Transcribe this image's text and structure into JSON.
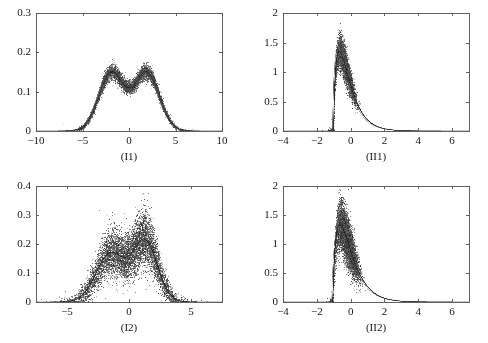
{
  "figure": {
    "background_color": "#ffffff",
    "width": 488,
    "height": 343,
    "layout": "2x2 grid of scatter-band density plots",
    "ink_color": "#262626",
    "axis_color": "#555555"
  },
  "chart_data": [
    {
      "id": "I1",
      "type": "scatter",
      "title": "",
      "caption": "(I1)",
      "xlabel": "",
      "ylabel": "",
      "xlim": [
        -10,
        10
      ],
      "ylim": [
        0,
        0.3
      ],
      "grid": false,
      "legend": "none",
      "xticks": [
        -10,
        -5,
        0,
        5,
        10
      ],
      "xtick_labels": [
        "-10",
        "-5",
        "0",
        "5",
        "10"
      ],
      "yticks": [
        0,
        0.1,
        0.2,
        0.3
      ],
      "ytick_labels": [
        "0",
        "0.1",
        "0.2",
        "0.3"
      ],
      "description": "Dense cloud of estimated bimodal density curves (mixture of two normals) plus smooth reference curves; symmetric twin peaks near x=-1.9 and x=+1.9 reaching about 0.195, local minimum near x=0 around 0.095, tails decaying to 0 by |x|=6.",
      "density_model": {
        "family": "gaussian-mixture",
        "components": [
          {
            "weight": 0.5,
            "mean": -1.9,
            "sd": 1.35
          },
          {
            "weight": 0.5,
            "mean": 1.9,
            "sd": 1.35
          }
        ]
      },
      "annotations": [
        {
          "x": -1.9,
          "y": 0.195,
          "text": "left peak"
        },
        {
          "x": 0.0,
          "y": 0.095,
          "text": "central dip"
        },
        {
          "x": 1.9,
          "y": 0.195,
          "text": "right peak"
        }
      ],
      "noise_scale": 0.055,
      "reference_curves": 6,
      "point_count": 5200,
      "point_size": 0.8
    },
    {
      "id": "II1",
      "type": "scatter",
      "title": "",
      "caption": "(II1)",
      "xlabel": "",
      "ylabel": "",
      "xlim": [
        -4,
        7
      ],
      "ylim": [
        0,
        2
      ],
      "grid": false,
      "legend": "none",
      "xticks": [
        -4,
        -2,
        0,
        2,
        4,
        6
      ],
      "xtick_labels": [
        "-4",
        "-2",
        "0",
        "2",
        "4",
        "6"
      ],
      "yticks": [
        0,
        0.5,
        1,
        1.5,
        2
      ],
      "ytick_labels": [
        "0",
        "0.5",
        "1",
        "1.5",
        "2"
      ],
      "description": "Right-skewed density estimates with a sharp left shoulder at x=-0.95; peak height about 1.35 on the solid reference curve with scatter reaching 1.6; long right tail decaying toward 0 by x=4.",
      "density_model": {
        "family": "shifted-gamma",
        "shift": -1.0,
        "shape": 1.6,
        "scale": 0.55,
        "peak_x": -0.85,
        "peak_y": 1.35
      },
      "annotations": [
        {
          "x": -0.85,
          "y": 1.35,
          "text": "mode"
        },
        {
          "x": 2.0,
          "y": 0.15,
          "text": "right tail"
        }
      ],
      "noise_scale": 0.09,
      "reference_curves": 3,
      "point_count": 5200,
      "point_size": 0.8
    },
    {
      "id": "I2",
      "type": "scatter",
      "title": "",
      "caption": "(I2)",
      "xlabel": "",
      "ylabel": "",
      "xlim": [
        -7.5,
        7.5
      ],
      "ylim": [
        0,
        0.4
      ],
      "grid": false,
      "legend": "none",
      "xticks": [
        -5,
        0,
        5
      ],
      "xtick_labels": [
        "-5",
        "0",
        "5"
      ],
      "yticks": [
        0,
        0.1,
        0.2,
        0.3,
        0.4
      ],
      "ytick_labels": [
        "0",
        "0.1",
        "0.2",
        "0.3",
        "0.4"
      ],
      "description": "Wide noisy cloud of bimodal density estimates; left peak near x=-1.5 at about 0.22 and right peak near x=1.3 reaching about 0.27 with scatter up to 0.35; dip near x=0 around 0.12; support roughly -4 to 4 with sparse points to the plot edges.",
      "density_model": {
        "family": "gaussian-mixture",
        "components": [
          {
            "weight": 0.48,
            "mean": -1.5,
            "sd": 1.15
          },
          {
            "weight": 0.52,
            "mean": 1.3,
            "sd": 1.0
          }
        ]
      },
      "annotations": [
        {
          "x": -1.5,
          "y": 0.22,
          "text": "left peak"
        },
        {
          "x": 0.0,
          "y": 0.12,
          "text": "central dip"
        },
        {
          "x": 1.3,
          "y": 0.27,
          "text": "right peak"
        }
      ],
      "noise_scale": 0.19,
      "reference_curves": 2,
      "point_count": 6400,
      "point_size": 0.9
    },
    {
      "id": "II2",
      "type": "scatter",
      "title": "",
      "caption": "(II2)",
      "xlabel": "",
      "ylabel": "",
      "xlim": [
        -4,
        7
      ],
      "ylim": [
        0,
        2
      ],
      "grid": false,
      "legend": "none",
      "xticks": [
        -4,
        -2,
        0,
        2,
        4,
        6
      ],
      "xtick_labels": [
        "-4",
        "-2",
        "0",
        "2",
        "4",
        "6"
      ],
      "yticks": [
        0,
        0.5,
        1,
        1.5,
        2
      ],
      "ytick_labels": [
        "0",
        "0.5",
        "1",
        "1.5",
        "2"
      ],
      "description": "Right-skewed density estimates similar to (II1) but with a broader noisier band; sharp left edge near x=-1.0, mode about 1.35 with scatter to 1.55, heavier shoulder around x=0 to 1 and tail reaching x=5.",
      "density_model": {
        "family": "shifted-gamma",
        "shift": -1.05,
        "shape": 1.7,
        "scale": 0.6,
        "peak_x": -0.85,
        "peak_y": 1.33
      },
      "annotations": [
        {
          "x": -0.85,
          "y": 1.33,
          "text": "mode"
        },
        {
          "x": 2.0,
          "y": 0.2,
          "text": "right tail"
        }
      ],
      "noise_scale": 0.14,
      "reference_curves": 2,
      "point_count": 6000,
      "point_size": 0.9
    }
  ],
  "panels": {
    "I1": {
      "caption": "(I1)",
      "box": {
        "left": 36,
        "top": 13,
        "width": 186,
        "height": 118
      }
    },
    "II1": {
      "caption": "(II1)",
      "box": {
        "left": 283,
        "top": 13,
        "width": 186,
        "height": 118
      }
    },
    "I2": {
      "caption": "(I2)",
      "box": {
        "left": 36,
        "top": 186,
        "width": 186,
        "height": 116
      }
    },
    "II2": {
      "caption": "(II2)",
      "box": {
        "left": 283,
        "top": 186,
        "width": 186,
        "height": 116
      }
    }
  }
}
